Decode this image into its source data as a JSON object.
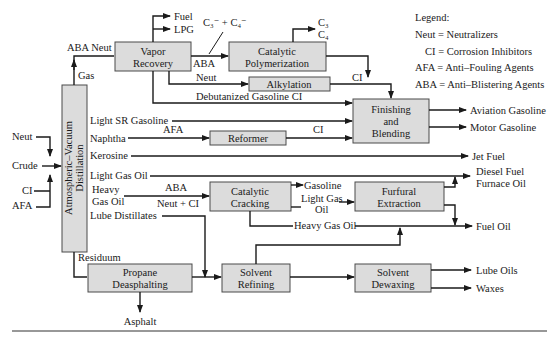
{
  "legend": {
    "heading": "Legend:",
    "items": [
      {
        "abbr": "Neut",
        "text": "Neut = Neutralizers"
      },
      {
        "abbr": "CI",
        "text": "CI = Corrosion Inhibitors"
      },
      {
        "abbr": "AFA",
        "text": "AFA = Anti–Fouling Agents"
      },
      {
        "abbr": "ABA",
        "text": "ABA = Anti–Blistering Agents"
      }
    ]
  },
  "units": {
    "distillation": [
      "Atmospheric–Vacuum",
      "Distillation"
    ],
    "vapor_recovery": [
      "Vapor",
      "Recovery"
    ],
    "cat_poly": [
      "Catalytic",
      "Polymerization"
    ],
    "alkylation": [
      "Alkylation"
    ],
    "finishing": [
      "Finishing",
      "and",
      "Blending"
    ],
    "reformer": [
      "Reformer"
    ],
    "cat_cracking": [
      "Catalytic",
      "Cracking"
    ],
    "furfural": [
      "Furfural",
      "Extraction"
    ],
    "propane_deasphalting": [
      "Propane",
      "Deasphalting"
    ],
    "solvent_refining": [
      "Solvent",
      "Refining"
    ],
    "solvent_dewaxing": [
      "Solvent",
      "Dewaxing"
    ]
  },
  "inputs": {
    "crude": "Crude",
    "neut": "Neut",
    "ci": "CI",
    "afa": "AFA"
  },
  "streams": {
    "gas": "Gas",
    "aba_neut": "ABA Neut",
    "fuel": "Fuel",
    "lpg": "LPG",
    "c3c4_olefins": "C₃⁻ + C₄⁻",
    "aba_poly": "ABA",
    "c3": "C₃",
    "c4": "C₄",
    "neut_alk": "Neut",
    "ci_poly": "CI",
    "debutanized": "Debutanized Gasoline CI",
    "light_sr_gasoline": "Light SR Gasoline",
    "naphtha": "Naphtha",
    "afa_naphtha": "AFA",
    "ci_reformer": "CI",
    "kerosine": "Kerosine",
    "light_gas_oil": "Light Gas Oil",
    "heavy_gas_oil_1": "Heavy",
    "heavy_gas_oil_2": "Gas Oil",
    "aba_cc": "ABA",
    "neut_ci_cc": "Neut + CI",
    "lube_distillates": "Lube Distillates",
    "residuum": "Residuum",
    "cc_gasoline": "Gasoline",
    "cc_lgo_1": "Light Gas",
    "cc_lgo_2": "Oil",
    "cc_hgo": "Heavy Gas Oil"
  },
  "products": {
    "aviation_gasoline": "Aviation Gasoline",
    "motor_gasoline": "Motor Gasoline",
    "jet_fuel": "Jet Fuel",
    "diesel_fuel": "Diesel Fuel",
    "furnace_oil": "Furnace Oil",
    "fuel_oil": "Fuel Oil",
    "lube_oils": "Lube Oils",
    "waxes": "Waxes",
    "asphalt": "Asphalt"
  },
  "colors": {
    "box_fill": "#dcdcdc",
    "line": "#1a1a1a",
    "background": "#ffffff"
  }
}
